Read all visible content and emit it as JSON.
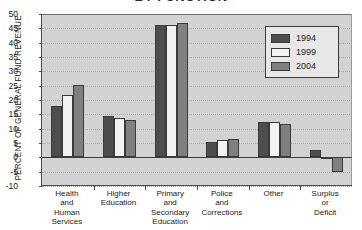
{
  "chart_data": {
    "type": "bar",
    "title": "BY FUNCTION",
    "xlabel": "",
    "ylabel": "PERCENT OF GENERAL FUND REVENUE",
    "ylim": [
      -10,
      50
    ],
    "ytick_step": 5,
    "yticks": [
      "50",
      "45",
      "40",
      "35",
      "30",
      "25",
      "20",
      "15",
      "10",
      "5",
      "0",
      "-5",
      "-10"
    ],
    "grid": true,
    "legend_position": "top-right",
    "categories": [
      "Health\nand\nHuman\nServices",
      "Higher\nEducation",
      "Primary\nand\nSecondary\nEducation",
      "Police\nand\nCorrections",
      "Other",
      "Surplus\nor\nDeficit"
    ],
    "series": [
      {
        "name": "1994",
        "color": "#4d4d4d",
        "values": [
          18.0,
          14.3,
          46.0,
          5.2,
          12.3,
          2.6
        ]
      },
      {
        "name": "1999",
        "color": "#f2f2f2",
        "values": [
          21.7,
          13.8,
          46.0,
          6.0,
          12.4,
          -0.2
        ]
      },
      {
        "name": "2004",
        "color": "#808080",
        "values": [
          25.4,
          13.0,
          47.0,
          6.5,
          11.8,
          -5.0
        ]
      }
    ]
  },
  "legend": {
    "items": [
      {
        "label": "1994"
      },
      {
        "label": "1999"
      },
      {
        "label": "2004"
      }
    ]
  }
}
